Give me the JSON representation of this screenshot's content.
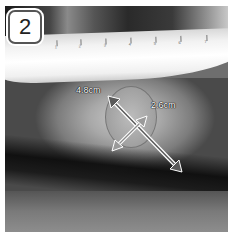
{
  "figure": {
    "panel_number": "2",
    "ruler_ticks": [
      "1",
      "2",
      "3",
      "4",
      "5",
      "6",
      "7"
    ],
    "measurements": [
      {
        "label": "4.8cm",
        "axis": "long-axis-arrow",
        "color": "#ffffff"
      },
      {
        "label": "2.6cm",
        "axis": "short-axis-arrow",
        "color": "#ffffff"
      }
    ]
  }
}
